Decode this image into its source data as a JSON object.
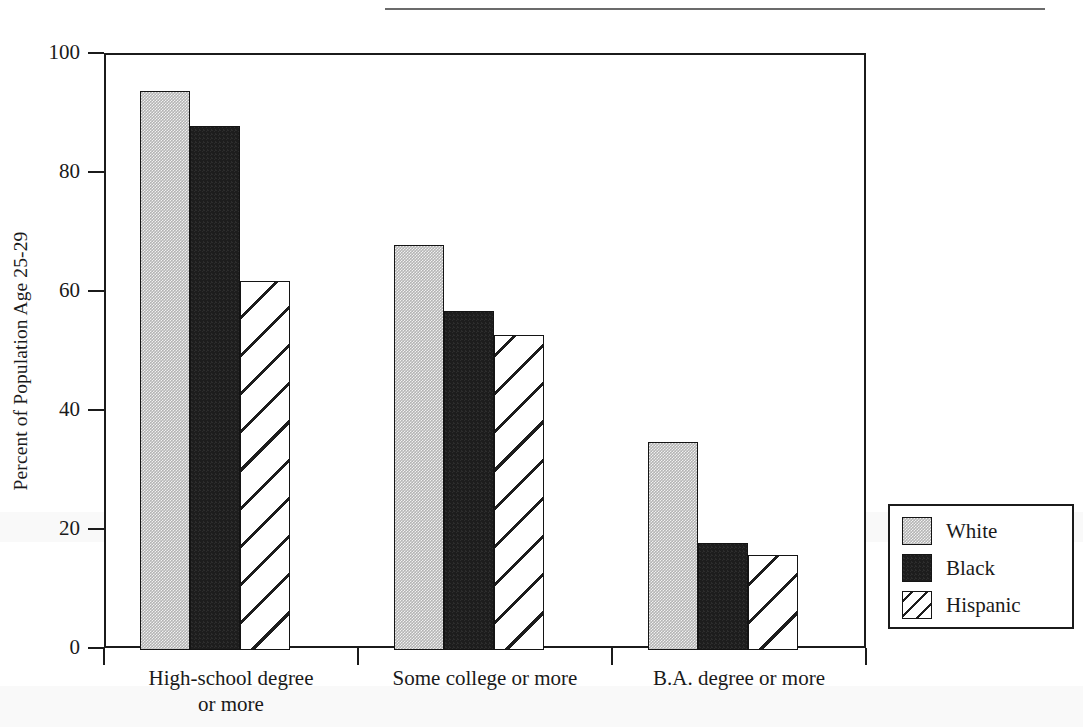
{
  "chart_data": {
    "type": "bar",
    "title": "",
    "subtitle": "",
    "xlabel": "",
    "ylabel": "Percent of Population Age 25-29",
    "ylim": [
      0,
      100
    ],
    "yticks": [
      0,
      20,
      40,
      60,
      80,
      100
    ],
    "ytick_labels": [
      "0",
      "20",
      "40",
      "60",
      "80",
      "100"
    ],
    "grid": false,
    "legend_position": "right-outside-bottom",
    "categories": [
      "High-school degree or more",
      "Some college or more",
      "B.A. degree or more"
    ],
    "category_labels": [
      [
        "High-school degree",
        "or more"
      ],
      [
        "Some college or more"
      ],
      [
        "B.A. degree or more"
      ]
    ],
    "series": [
      {
        "name": "White",
        "values": [
          94,
          68,
          35
        ],
        "fill": "solid-gray",
        "color": "#b4b4b4"
      },
      {
        "name": "Black",
        "values": [
          88,
          57,
          18
        ],
        "fill": "solid-black",
        "color": "#1d1d1d"
      },
      {
        "name": "Hispanic",
        "values": [
          62,
          53,
          16
        ],
        "fill": "diagonal-hatch",
        "color": "#ffffff"
      }
    ],
    "annotations": []
  },
  "legend": {
    "entries": [
      {
        "label": "White",
        "swatch": "gray-solid-swatch"
      },
      {
        "label": "Black",
        "swatch": "black-solid-swatch"
      },
      {
        "label": "Hispanic",
        "swatch": "hatched-swatch"
      }
    ]
  }
}
